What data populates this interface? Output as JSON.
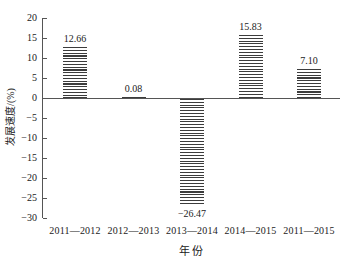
{
  "chart_data": {
    "type": "bar",
    "title": "",
    "categories": [
      "2011—2012",
      "2012—2013",
      "2013—2014",
      "2014—2015",
      "2011—2015"
    ],
    "values": [
      12.66,
      0.08,
      -26.47,
      15.83,
      7.1
    ],
    "value_labels": [
      "12.66",
      "0.08",
      "−26.47",
      "15.83",
      "7.10"
    ],
    "xlabel": "年  份",
    "ylabel": "发展速度/(%)",
    "ylim": [
      -30,
      20
    ],
    "ytick_step": 5,
    "ytick_labels": [
      "20",
      "15",
      "10",
      "5",
      "0",
      "−5",
      "−10",
      "−15",
      "−20",
      "−25",
      "−30"
    ],
    "grid": false,
    "legend": "none",
    "bar_pattern": "horizontal-stripes",
    "colors": {
      "stripe": "#3c3c3c",
      "axis": "#555555",
      "text": "#222222",
      "background": "#ffffff"
    }
  }
}
